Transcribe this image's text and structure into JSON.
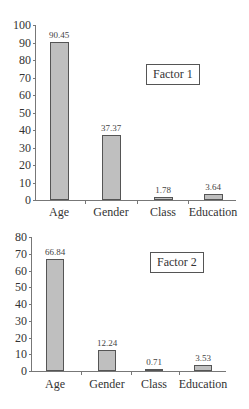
{
  "chart_data": [
    {
      "type": "bar",
      "title": "Factor 1",
      "categories": [
        "Age",
        "Gender",
        "Class",
        "Education"
      ],
      "values": [
        90.45,
        37.37,
        1.78,
        3.64
      ],
      "value_labels": [
        "90.45",
        "37.37",
        "1.78",
        "3.64"
      ],
      "yticks": [
        "0",
        "10",
        "20",
        "30",
        "40",
        "50",
        "60",
        "70",
        "80",
        "90",
        "100"
      ],
      "ylim": [
        0,
        100
      ],
      "xlabel": "",
      "ylabel": "",
      "grid": false,
      "legend": "Factor 1",
      "legend_position": "upper right",
      "bar_color": "#bfbfbf"
    },
    {
      "type": "bar",
      "title": "Factor 2",
      "categories": [
        "Age",
        "Gender",
        "Class",
        "Education"
      ],
      "values": [
        66.84,
        12.24,
        0.71,
        3.53
      ],
      "value_labels": [
        "66.84",
        "12.24",
        "0.71",
        "3.53"
      ],
      "yticks": [
        "0",
        "10",
        "20",
        "30",
        "40",
        "50",
        "60",
        "70",
        "80"
      ],
      "ylim": [
        0,
        80
      ],
      "xlabel": "",
      "ylabel": "",
      "grid": false,
      "legend": "Factor 2",
      "legend_position": "upper right",
      "bar_color": "#bfbfbf"
    }
  ]
}
